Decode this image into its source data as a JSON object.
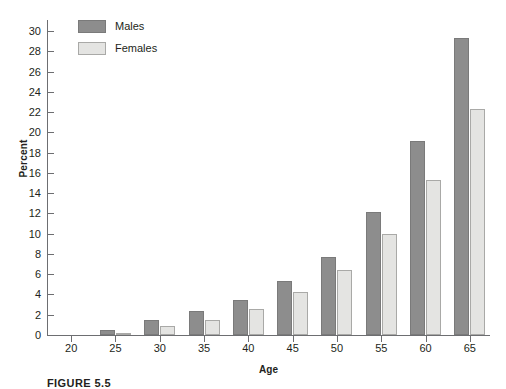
{
  "chart_data": {
    "type": "bar",
    "title": "",
    "xlabel": "Age",
    "ylabel": "Percent",
    "categories": [
      "20",
      "25",
      "30",
      "35",
      "40",
      "45",
      "50",
      "55",
      "60",
      "65"
    ],
    "series": [
      {
        "name": "Males",
        "color": "#8d8d8d",
        "values": [
          0,
          0.5,
          1.5,
          2.4,
          3.5,
          5.3,
          7.7,
          12.1,
          19.1,
          29.3
        ]
      },
      {
        "name": "Females",
        "color": "#e4e4e2",
        "values": [
          0,
          0.2,
          0.9,
          1.5,
          2.6,
          4.2,
          6.4,
          10.0,
          15.3,
          22.3
        ]
      }
    ],
    "ylim": [
      0,
      30
    ],
    "yticks": [
      0,
      2,
      4,
      6,
      8,
      10,
      12,
      14,
      16,
      18,
      20,
      22,
      24,
      26,
      28,
      30
    ],
    "ytick_labels": [
      "0",
      "2",
      "4",
      "6",
      "8",
      "10",
      "12",
      "14",
      "16",
      "18",
      "20",
      "22",
      "24",
      "26",
      "28",
      "30"
    ],
    "grid": false,
    "legend_position": "top-left",
    "legend": [
      "Males",
      "Females"
    ]
  },
  "caption": {
    "text": "FIGURE 5.5"
  }
}
